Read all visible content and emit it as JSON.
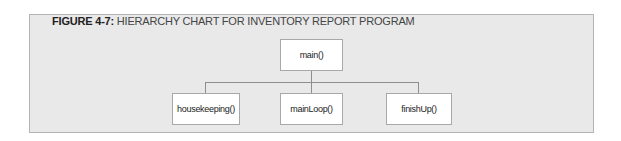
{
  "figure": {
    "label": "FIGURE 4-7:",
    "title": "HIERARCHY CHART FOR INVENTORY REPORT PROGRAM"
  },
  "chart": {
    "root": {
      "label": "main()"
    },
    "children": [
      {
        "label": "housekeeping()"
      },
      {
        "label": "mainLoop()"
      },
      {
        "label": "finishUp()"
      }
    ]
  },
  "colors": {
    "panel_background": "#e9e9e9",
    "panel_border": "#b4b4b4",
    "node_background": "#ffffff",
    "node_border": "#a8a8a8",
    "connector": "#8e8e8e"
  }
}
